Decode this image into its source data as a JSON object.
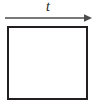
{
  "figure": {
    "type": "diagram",
    "background_color": "#ffffff",
    "time_arrow": {
      "label": "t",
      "label_style": "italic",
      "direction": "right",
      "line_color": "#4d4d4d",
      "head_color": "#4d4d4d",
      "icon": "arrow-right-icon",
      "x_start": 5,
      "x_end": 92,
      "y": 18
    },
    "box": {
      "shape": "square",
      "fill_color": "#ffffff",
      "stroke_color": "#231f20",
      "stroke_width": 2,
      "x": 7,
      "y": 26,
      "width": 80,
      "height": 73
    }
  }
}
